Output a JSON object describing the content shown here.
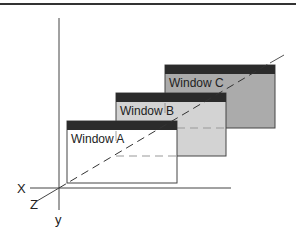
{
  "diagram": {
    "axes": {
      "x_label": "X",
      "y_label": "y",
      "z_label": "Z"
    },
    "windows": [
      {
        "id": "C",
        "label": "Window C",
        "body_color": "#ababab",
        "title_color": "#2b2b2b"
      },
      {
        "id": "B",
        "label": "Window B",
        "body_color": "#d3d3d3",
        "title_color": "#2b2b2b"
      },
      {
        "id": "A",
        "label": "Window A",
        "body_color": "#ffffff",
        "title_color": "#2b2b2b"
      }
    ],
    "colors": {
      "border": "#333333",
      "axis": "#333333",
      "top_rule": "#333333",
      "hidden_line": "#888888"
    }
  }
}
